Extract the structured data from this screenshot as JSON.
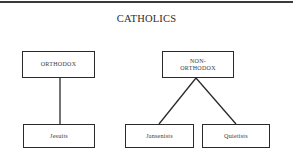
{
  "diagram": {
    "title": "CATHOLICS",
    "nodes": {
      "orthodox": {
        "label": "ORTHODOX"
      },
      "non_orthodox": {
        "label_line1": "NON-",
        "label_line2": "ORTHODOX"
      },
      "jesuits": {
        "label": "Jesuits"
      },
      "jansenists": {
        "label": "Jansenists"
      },
      "quietists": {
        "label": "Quietists"
      }
    },
    "edges": [
      {
        "from": "ORTHODOX",
        "to": "Jesuits"
      },
      {
        "from": "NON-ORTHODOX",
        "to": "Jansenists"
      },
      {
        "from": "NON-ORTHODOX",
        "to": "Quietists"
      }
    ],
    "colors": {
      "line": "#2a2a2a",
      "background": "#ffffff"
    }
  }
}
